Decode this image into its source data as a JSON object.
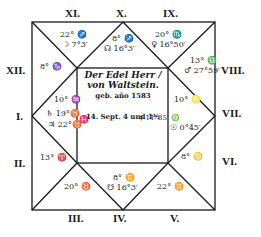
{
  "chart": {
    "title_line1": "Der Edel Herr /",
    "title_line2": "von Waltstein.",
    "title_line3": "geb. año 1583",
    "title_line4": "14. Sept. 4 und 1½",
    "houses": {
      "I": "I.",
      "II": "II.",
      "III": "III.",
      "IV": "IV.",
      "V": "V.",
      "VI": "VI.",
      "VII": "VII.",
      "VIII": "VIII.",
      "IX": "IX.",
      "X": "X.",
      "XI": "XI.",
      "XII": "XII."
    },
    "cusps": {
      "XI": "22° ♐",
      "XI_planet": "☽ 7°3′",
      "X": "8° ♐",
      "X_planet": "☊ 16°3′",
      "IX": "20° ♏",
      "IX_planet": "♀ 16°50′",
      "VIII": "13° ♎",
      "VIII_planet": "♂ 27°59′",
      "XII": "8° ♑",
      "I_top": "10° ♒",
      "I_planet1": "♄ 19°♉",
      "I_planet2": "♃ 22°♉",
      "I_sign": "♓",
      "VII_top": "10° ♌",
      "VII_planet1": "☿ 11°35′ ♍",
      "VII_planet2": "☉ 0°45′",
      "II": "13° ♈",
      "III": "20° ♉",
      "IV": "8° ♊",
      "IV_planet": "☋ 16°3′",
      "V": "22° ♊",
      "VI": "8° ♋"
    }
  }
}
